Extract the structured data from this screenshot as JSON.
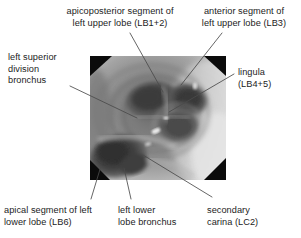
{
  "figure": {
    "type": "annotated-medical-photograph",
    "modality": "bronchoscopy",
    "region": "left main bronchus / left upper lobe carina",
    "background_color": "#ffffff",
    "text_color": "#1c1c1c",
    "leader_line_color": "#4a4a4a"
  },
  "image": {
    "alt_name": "bronchoscopic-view-left-bronchial-tree",
    "x": 90,
    "y": 56,
    "width": 136,
    "height": 124,
    "grayscale": true,
    "vignette_corners": "black-triangles"
  },
  "annotations": [
    {
      "id": "lb12",
      "label": "apicoposterior segment of\nleft upper lobe (LB1+2)",
      "align": "center",
      "leader": {
        "x1": 130,
        "y1": 33,
        "x2": 163,
        "y2": 92
      }
    },
    {
      "id": "lb3",
      "label": "anterior segment of\nleft upper lobe (LB3)",
      "align": "center",
      "leader": {
        "x1": 222,
        "y1": 33,
        "x2": 181,
        "y2": 85
      }
    },
    {
      "id": "lsdb",
      "label": "left superior\ndivision\nbronchus",
      "align": "left",
      "leader": {
        "x1": 70,
        "y1": 86,
        "x2": 137,
        "y2": 118
      }
    },
    {
      "id": "lingula",
      "label": "lingula\n(LB4+5)",
      "align": "left",
      "leader": {
        "x1": 234,
        "y1": 74,
        "x2": 169,
        "y2": 112
      }
    },
    {
      "id": "lb6",
      "label": "apical segment of left\nlower lobe (LB6)",
      "align": "left",
      "leader": {
        "x1": 91,
        "y1": 199,
        "x2": 101,
        "y2": 166
      }
    },
    {
      "id": "llb",
      "label": "left lower\nlobe bronchus",
      "align": "left",
      "leader": {
        "x1": 131,
        "y1": 199,
        "x2": 124,
        "y2": 168
      }
    },
    {
      "id": "lc2",
      "label": "secondary\ncarina (LC2)",
      "align": "left",
      "leader": {
        "x1": 212,
        "y1": 197,
        "x2": 143,
        "y2": 155
      }
    }
  ]
}
